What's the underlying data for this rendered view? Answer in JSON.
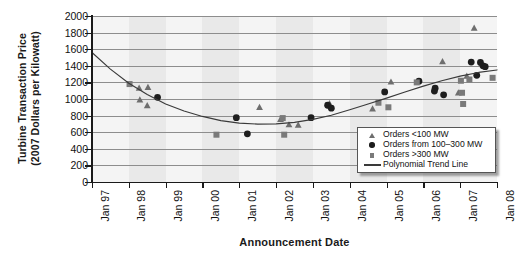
{
  "chart_data": {
    "type": "scatter",
    "title": "",
    "xlabel": "Announcement Date",
    "ylabel_line1": "Turbine Transaction Price",
    "ylabel_line2": "(2007 Dollars per Kilowatt)",
    "ylim": [
      0,
      2000
    ],
    "yticks": [
      2000,
      1800,
      1600,
      1400,
      1200,
      1000,
      800,
      600,
      400,
      200,
      0
    ],
    "xticks": [
      "Jan 97",
      "Jan 98",
      "Jan 99",
      "Jan 00",
      "Jan 01",
      "Jan 02",
      "Jan 03",
      "Jan 04",
      "Jan 05",
      "Jan 06",
      "Jan 07",
      "Jan 08"
    ],
    "xlim_years": [
      1997.0,
      2008.0
    ],
    "grid": "horizontal",
    "legend_position": "bottom-right",
    "series": [
      {
        "name": "Orders <100 MW",
        "marker": "triangle",
        "color": "#6e6e6e",
        "points": [
          {
            "x": 1998.28,
            "y": 1130
          },
          {
            "x": 1998.3,
            "y": 990
          },
          {
            "x": 1998.52,
            "y": 1140
          },
          {
            "x": 1998.5,
            "y": 920
          },
          {
            "x": 2001.55,
            "y": 900
          },
          {
            "x": 2002.12,
            "y": 755
          },
          {
            "x": 2002.35,
            "y": 690
          },
          {
            "x": 2002.6,
            "y": 685
          },
          {
            "x": 2003.45,
            "y": 945
          },
          {
            "x": 2004.62,
            "y": 880
          },
          {
            "x": 2005.12,
            "y": 1205
          },
          {
            "x": 2006.52,
            "y": 1450
          },
          {
            "x": 2006.95,
            "y": 1075
          },
          {
            "x": 2007.18,
            "y": 1275
          },
          {
            "x": 2007.38,
            "y": 1855
          }
        ]
      },
      {
        "name": "Orders from 100–300 MW",
        "marker": "circle",
        "color": "#1d1d1d",
        "points": [
          {
            "x": 1998.78,
            "y": 1020
          },
          {
            "x": 2000.92,
            "y": 775
          },
          {
            "x": 2001.22,
            "y": 580
          },
          {
            "x": 2002.95,
            "y": 775
          },
          {
            "x": 2003.4,
            "y": 925
          },
          {
            "x": 2003.5,
            "y": 890
          },
          {
            "x": 2004.95,
            "y": 1085
          },
          {
            "x": 2005.88,
            "y": 1215
          },
          {
            "x": 2006.32,
            "y": 1130
          },
          {
            "x": 2006.3,
            "y": 1095
          },
          {
            "x": 2006.55,
            "y": 1050
          },
          {
            "x": 2007.3,
            "y": 1445
          },
          {
            "x": 2007.55,
            "y": 1440
          },
          {
            "x": 2007.62,
            "y": 1400
          },
          {
            "x": 2007.68,
            "y": 1390
          },
          {
            "x": 2007.45,
            "y": 1285
          }
        ]
      },
      {
        "name": "Orders >300 MW",
        "marker": "square",
        "color": "#7a7a7a",
        "points": [
          {
            "x": 1998.02,
            "y": 1180
          },
          {
            "x": 2000.38,
            "y": 570
          },
          {
            "x": 2002.18,
            "y": 770
          },
          {
            "x": 2002.22,
            "y": 570
          },
          {
            "x": 2004.78,
            "y": 955
          },
          {
            "x": 2005.05,
            "y": 900
          },
          {
            "x": 2005.82,
            "y": 1200
          },
          {
            "x": 2007.02,
            "y": 1220
          },
          {
            "x": 2007.05,
            "y": 1075
          },
          {
            "x": 2007.08,
            "y": 940
          },
          {
            "x": 2007.25,
            "y": 1235
          },
          {
            "x": 2007.88,
            "y": 1255
          }
        ]
      }
    ],
    "trend": {
      "name": "Polynomial Trend Line",
      "color": "#3a3a3a",
      "points": [
        {
          "x": 1997.0,
          "y": 1560
        },
        {
          "x": 1997.5,
          "y": 1360
        },
        {
          "x": 1998.0,
          "y": 1190
        },
        {
          "x": 1998.5,
          "y": 1055
        },
        {
          "x": 1999.0,
          "y": 940
        },
        {
          "x": 1999.5,
          "y": 855
        },
        {
          "x": 2000.0,
          "y": 790
        },
        {
          "x": 2000.5,
          "y": 740
        },
        {
          "x": 2001.0,
          "y": 710
        },
        {
          "x": 2001.5,
          "y": 698
        },
        {
          "x": 2002.0,
          "y": 700
        },
        {
          "x": 2002.5,
          "y": 718
        },
        {
          "x": 2003.0,
          "y": 755
        },
        {
          "x": 2003.5,
          "y": 805
        },
        {
          "x": 2004.0,
          "y": 870
        },
        {
          "x": 2004.5,
          "y": 940
        },
        {
          "x": 2005.0,
          "y": 1010
        },
        {
          "x": 2005.5,
          "y": 1085
        },
        {
          "x": 2006.0,
          "y": 1155
        },
        {
          "x": 2006.5,
          "y": 1220
        },
        {
          "x": 2007.0,
          "y": 1275
        },
        {
          "x": 2007.5,
          "y": 1320
        },
        {
          "x": 2008.0,
          "y": 1350
        }
      ]
    }
  },
  "legend": {
    "items": [
      {
        "label": "Orders <100 MW",
        "symbol": "triangle-marker"
      },
      {
        "label": "Orders from 100–300 MW",
        "symbol": "circle-marker"
      },
      {
        "label": "Orders >300 MW",
        "symbol": "square-marker"
      },
      {
        "label": "Polynomial Trend Line",
        "symbol": "line-marker"
      }
    ]
  }
}
